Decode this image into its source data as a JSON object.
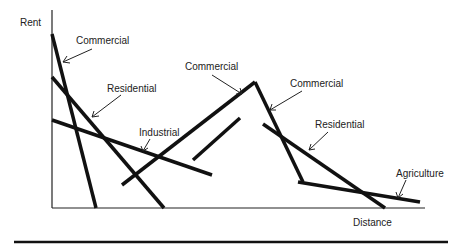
{
  "diagram": {
    "type": "bid-rent curves",
    "axes": {
      "y_label": "Rent",
      "x_label": "Distance"
    },
    "curves": [
      {
        "label": "Commercial",
        "zone": "central"
      },
      {
        "label": "Residential",
        "zone": "central"
      },
      {
        "label": "Industrial",
        "zone": "central"
      },
      {
        "label": "Commercial",
        "zone": "secondary-center-left"
      },
      {
        "label": "Commercial",
        "zone": "secondary-center-right"
      },
      {
        "label": "Residential",
        "zone": "secondary"
      },
      {
        "label": "Agriculture",
        "zone": "outer"
      }
    ],
    "labels": {
      "rent": "Rent",
      "distance": "Distance",
      "commercial_1": "Commercial",
      "residential_1": "Residential",
      "industrial": "Industrial",
      "commercial_2": "Commercial",
      "commercial_3": "Commercial",
      "residential_2": "Residential",
      "agriculture": "Agriculture"
    }
  }
}
